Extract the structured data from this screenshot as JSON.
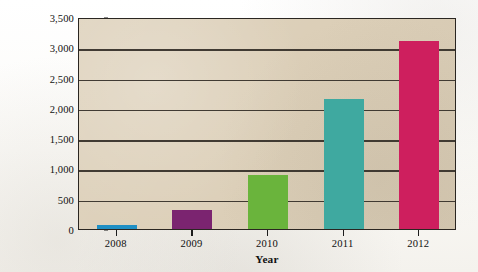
{
  "chart_data": {
    "type": "bar",
    "title": "",
    "subtitle": "",
    "categories": [
      "2008",
      "2009",
      "2010",
      "2011",
      "2012"
    ],
    "values": [
      70,
      320,
      900,
      2150,
      3100
    ],
    "xlabel": "Year",
    "ylabel": "E-Book Sales Growth, 2008–2012 (millions of dollars)",
    "ylabel_line1": "E-Book Sales Growth, 2008–2012",
    "ylabel_line2": "(millions of dollars)",
    "ylim": [
      0,
      3500
    ],
    "ytick_values": [
      0,
      500,
      1000,
      1500,
      2000,
      2500,
      3000,
      3500
    ],
    "ytick_labels": [
      "0",
      "500",
      "1,000",
      "1,500",
      "2,000",
      "2,500",
      "3,000",
      "3,500"
    ],
    "grid": true,
    "grid_axis": "y",
    "legend": false,
    "legend_position": "none",
    "bar_colors": [
      "#1f8fc4",
      "#7b2470",
      "#6ab43c",
      "#3fa9a0",
      "#ce1f5e"
    ],
    "series": [
      {
        "name": "E-Book Sales Growth",
        "values": [
          70,
          320,
          900,
          2150,
          3100
        ]
      }
    ],
    "points": [
      {
        "category": "2008",
        "value": 70,
        "color": "#1f8fc4"
      },
      {
        "category": "2009",
        "value": 320,
        "color": "#7b2470"
      },
      {
        "category": "2010",
        "value": 900,
        "color": "#6ab43c"
      },
      {
        "category": "2011",
        "value": 2150,
        "color": "#3fa9a0"
      },
      {
        "category": "2012",
        "value": 3100,
        "color": "#ce1f5e"
      }
    ]
  },
  "style": {
    "plot_background": "#dccfb8",
    "axis_color": "#2a2621",
    "gridline_color": "#332e27",
    "page_background": "#fdfdfb",
    "text_color": "#101010"
  }
}
